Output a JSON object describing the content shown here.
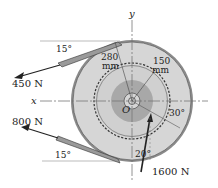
{
  "diagram": {
    "labels": {
      "y_axis": "y",
      "x_axis": "x",
      "center": "O",
      "radius_outer": "280",
      "radius_outer_unit": "mm",
      "radius_gear": "150",
      "radius_gear_unit": "mm",
      "angle_top_belt": "15°",
      "angle_bottom_belt": "15°",
      "angle_gear_force_30": "30°",
      "angle_gear_force_20": "20°"
    },
    "forces": [
      {
        "label": "450 N",
        "location": "upper belt"
      },
      {
        "label": "800 N",
        "location": "lower belt"
      },
      {
        "label": "1600 N",
        "location": "gear tooth"
      }
    ],
    "colors": {
      "pulley_fill": "#d6d6d6",
      "hub_fill": "#a8a8a8",
      "belt_fill": "#9a9a9a",
      "line": "#222222",
      "axis": "#777777"
    }
  }
}
